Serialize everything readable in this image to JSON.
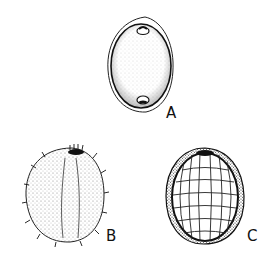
{
  "figure": {
    "panels": [
      {
        "id": "A",
        "label": "A",
        "description": "Smooth ovoid seed with outer membrane and two pores"
      },
      {
        "id": "B",
        "label": "B",
        "description": "Spiny granular seed, exterior view"
      },
      {
        "id": "C",
        "label": "C",
        "description": "Seed with reticulate inner surface, cut view"
      }
    ],
    "colors": {
      "ink": "#111111",
      "background": "#ffffff",
      "stipple": "#555555"
    }
  }
}
